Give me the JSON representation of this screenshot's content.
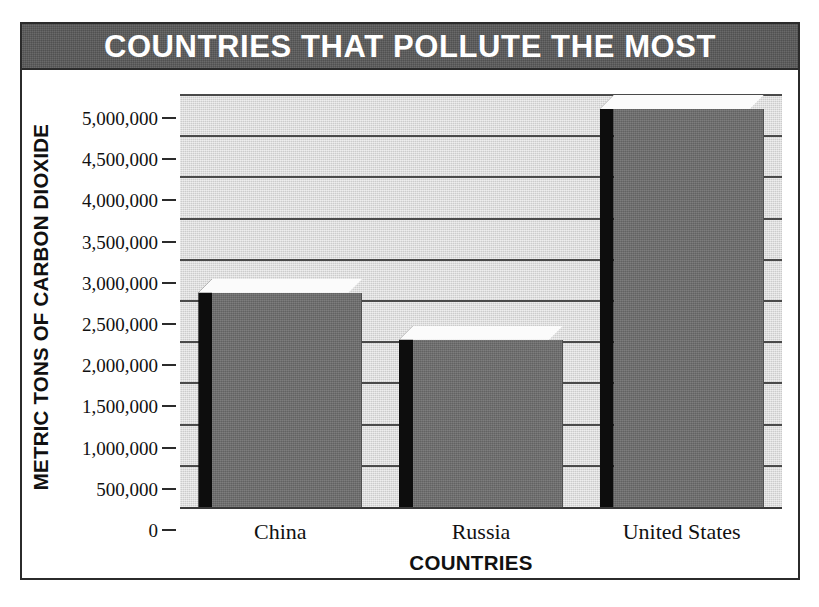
{
  "figure": {
    "title": "COUNTRIES THAT POLLUTE THE MOST",
    "title_bg_color": "#595959",
    "title_text_color": "#ffffff",
    "frame_color": "#2b2b2b",
    "plot_bg_color": "#dcdcdc",
    "gridline_color": "#4a4a4a",
    "bar_face_color": "#6e6e6e",
    "bar_side_color": "#0d0d0d",
    "bar_top_color": "#fbfbfb"
  },
  "chart_data": {
    "type": "bar",
    "title": "COUNTRIES THAT POLLUTE THE MOST",
    "xlabel": "COUNTRIES",
    "ylabel": "METRIC TONS OF CARBON DIOXIDE",
    "categories": [
      "China",
      "Russia",
      "United States"
    ],
    "values": [
      2600000,
      2030000,
      4830000
    ],
    "ylim": [
      0,
      5000000
    ],
    "ytick_step": 500000,
    "ytick_labels": [
      "5,000,000",
      "4,500,000",
      "4,000,000",
      "3,500,000",
      "3,000,000",
      "2,500,000",
      "2,000,000",
      "1,500,000",
      "1,000,000",
      "500,000",
      "0"
    ],
    "ytick_values": [
      5000000,
      4500000,
      4000000,
      3500000,
      3000000,
      2500000,
      2000000,
      1500000,
      1000000,
      500000,
      0
    ],
    "grid": true,
    "grid_axis": "y",
    "legend": false,
    "legend_position": "none",
    "style": "3d-bar"
  }
}
